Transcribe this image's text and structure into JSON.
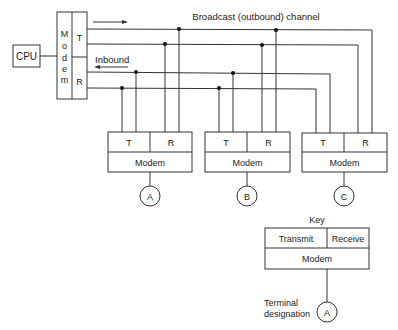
{
  "diagram": {
    "title": "Broadcast (outbound) channel",
    "inbound_label": "Inbound",
    "cpu_label": "CPU",
    "central_modem": {
      "letters": [
        "M",
        "o",
        "d",
        "e",
        "m"
      ],
      "transmit": "T",
      "receive": "R"
    },
    "terminals": [
      {
        "id": "A",
        "transmit": "T",
        "receive": "R",
        "modem": "Modem",
        "designation": "A"
      },
      {
        "id": "B",
        "transmit": "T",
        "receive": "R",
        "modem": "Modem",
        "designation": "B"
      },
      {
        "id": "C",
        "transmit": "T",
        "receive": "R",
        "modem": "Modem",
        "designation": "C"
      }
    ],
    "key": {
      "title": "Key",
      "transmit": "Transmit",
      "receive": "Receive",
      "modem": "Modem",
      "designation_label_line1": "Terminal",
      "designation_label_line2": "designation",
      "designation": "A"
    }
  }
}
